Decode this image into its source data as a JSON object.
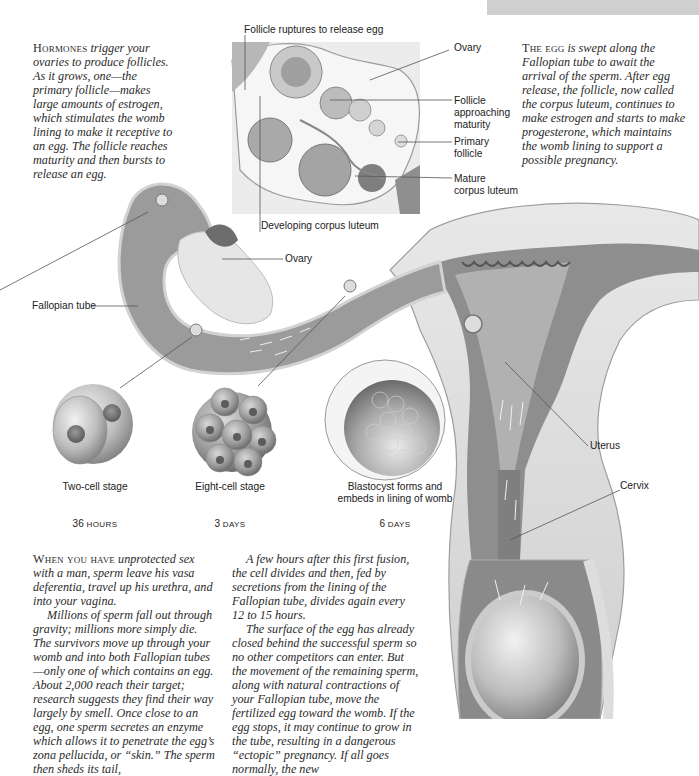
{
  "header_bar": {
    "color": "#cfcfcf"
  },
  "intro_left": {
    "lead": "Hormones",
    "body": "trigger your ovaries to produce follicles. As it grows, one—the primary follicle—makes large amounts of estrogen, which stimulates the womb lining to make it receptive to an egg. The follicle reaches maturity and then bursts to release an egg."
  },
  "intro_right": {
    "lead": "The egg",
    "body": "is swept along the Fallopian tube to await the arrival of the sperm. After egg release, the follicle, now called the corpus luteum, continues to make estrogen and starts to make progesterone, which maintains the womb lining to support a possible pregnancy."
  },
  "ovary_inset_labels": {
    "rupture": "Follicle ruptures to release egg",
    "ovary": "Ovary",
    "approaching_1": "Follicle",
    "approaching_2": "approaching",
    "approaching_3": "maturity",
    "primary_1": "Primary",
    "primary_2": "follicle",
    "mature_1": "Mature",
    "mature_2": "corpus luteum",
    "developing": "Developing corpus luteum"
  },
  "main_labels": {
    "ovary": "Ovary",
    "fallopian_tube": "Fallopian tube",
    "uterus": "Uterus",
    "cervix": "Cervix"
  },
  "stages": [
    {
      "label": "Two-cell stage",
      "label2": "",
      "time_num": "36",
      "time_unit": "hours"
    },
    {
      "label": "Eight-cell stage",
      "label2": "",
      "time_num": "3",
      "time_unit": "days"
    },
    {
      "label": "Blastocyst forms and",
      "label2": "embeds in lining of womb",
      "time_num": "6",
      "time_unit": "days"
    }
  ],
  "body_left": {
    "lead": "When you have",
    "p1": "unprotected sex with a man, sperm leave his vasa deferentia, travel up his urethra, and into your vagina.",
    "p2": "Millions of sperm fall out through gravity; millions more simply die. The survivors move up through your womb and into both Fallopian tubes—only one of which contains an egg. About 2,000 reach their target; research suggests they find their way largely by smell. Once close to an egg, one sperm secretes an enzyme which allows it to penetrate the egg’s zona pellucida, or “skin.” The sperm then sheds its tail,"
  },
  "body_right": {
    "p1": "A few hours after this first fusion, the cell divides and then, fed by secretions from the lining of the Fallopian tube, divides again every 12 to 15 hours.",
    "p2": "The surface of the egg has already closed behind the successful sperm so no other competitors can enter. But the movement of the remaining sperm, along with natural contractions of your Fallopian tube, move the fertilized egg toward the womb. If the egg stops, it may continue to grow in the tube, resulting in a dangerous “ectopic” pregnancy. If all goes normally, the new"
  }
}
